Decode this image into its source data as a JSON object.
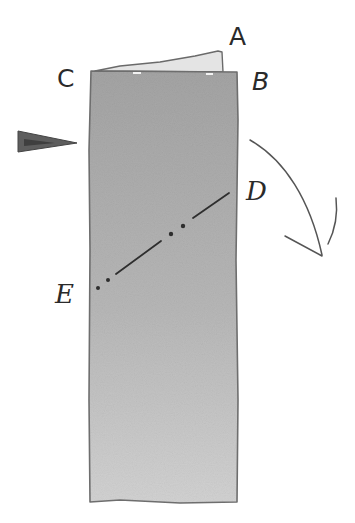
{
  "figure": {
    "colors": {
      "background": "#ffffff",
      "paper_top": "#a6a6a6",
      "paper_bottom": "#cfcfcf",
      "outline": "#6e6e6e",
      "flap": "#e6e6e6",
      "ink": "#3a3a3a",
      "marker": "#5a5a5a"
    },
    "labels": {
      "A": "A",
      "B": "B",
      "C": "C",
      "D": "D",
      "E": "E"
    },
    "annotations": {
      "fold_line": "E–D dash-dot fold line",
      "arrow": "curved fold-direction arrow (clockwise, downward)",
      "marker": "left-side pointer triangle"
    }
  }
}
